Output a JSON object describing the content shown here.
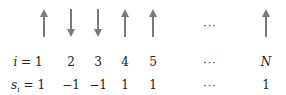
{
  "arrow_color": "#7a7a7a",
  "spins": [
    {
      "x": 44,
      "dir": "up",
      "index": "1",
      "value": "1"
    },
    {
      "x": 71,
      "dir": "down",
      "index": "2",
      "value": "−1"
    },
    {
      "x": 98,
      "dir": "down",
      "index": "3",
      "value": "−1"
    },
    {
      "x": 125,
      "dir": "up",
      "index": "4",
      "value": "1"
    },
    {
      "x": 153,
      "dir": "up",
      "index": "5",
      "value": "1"
    },
    {
      "x": 266,
      "dir": "up",
      "index": "N",
      "value": "1"
    }
  ],
  "labels": {
    "index_prefix": "i = ",
    "value_prefix_s": "s",
    "value_prefix_sub": "i",
    "value_prefix_eq": " = ",
    "ellipsis": "···"
  }
}
